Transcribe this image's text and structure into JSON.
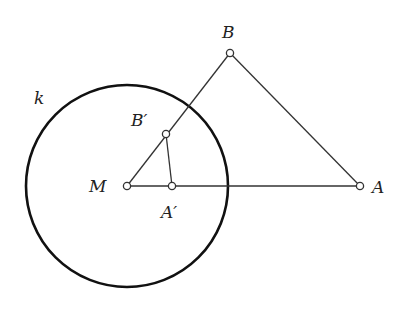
{
  "diagram": {
    "type": "geometric-construction",
    "circle": {
      "label": "k",
      "center": "M",
      "cx": 127,
      "cy": 186,
      "r": 101
    },
    "points": {
      "M": {
        "label": "M",
        "x": 127,
        "y": 186
      },
      "A": {
        "label": "A",
        "x": 360,
        "y": 186
      },
      "B": {
        "label": "B",
        "x": 230,
        "y": 53
      },
      "A_prime": {
        "label": "A′",
        "x": 172,
        "y": 186
      },
      "B_prime": {
        "label": "B′",
        "x": 166,
        "y": 134
      }
    },
    "segments": [
      [
        "M",
        "A"
      ],
      [
        "M",
        "B"
      ],
      [
        "B",
        "A"
      ],
      [
        "A_prime",
        "B_prime"
      ]
    ],
    "colors": {
      "stroke": "#333333",
      "circle": "#111111",
      "background": "#ffffff"
    }
  }
}
